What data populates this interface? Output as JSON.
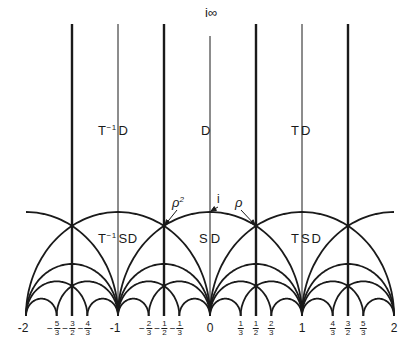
{
  "diagram": {
    "colors": {
      "line": "#1a1a1a",
      "background": "#ffffff"
    },
    "coords": {
      "origin_px_x": 210,
      "baseline_px_y": 316,
      "scale_x": 92,
      "scale_y": 104,
      "top_px_y": 24
    },
    "top_label": "i∞",
    "regions": {
      "t_inv_d": {
        "base": "T",
        "sup": "−1",
        "rest": "D"
      },
      "d": "D",
      "t_d": "TD",
      "t_inv_sd": {
        "base": "T",
        "sup": "−1",
        "rest": "SD"
      },
      "sd": "SD",
      "t_sd": "TSD"
    },
    "points": {
      "rho2": {
        "base": "ρ",
        "sup": "2"
      },
      "i": "i",
      "rho": "ρ"
    },
    "thick_verticals": [
      -1.5,
      -0.5,
      0.5,
      1.5
    ],
    "thin_verticals": [
      -1,
      0,
      1
    ],
    "axis_labels": {
      "integers": [
        {
          "value": -2,
          "text": "-2"
        },
        {
          "value": -1,
          "text": "-1"
        },
        {
          "value": 0,
          "text": "0"
        },
        {
          "value": 1,
          "text": "1"
        },
        {
          "value": 2,
          "text": "2"
        }
      ],
      "fractions": [
        {
          "value": -1.6667,
          "sign": "−",
          "num": "5",
          "den": "3"
        },
        {
          "value": -1.5,
          "sign": "−",
          "num": "3",
          "den": "2"
        },
        {
          "value": -1.3333,
          "sign": "−",
          "num": "4",
          "den": "3"
        },
        {
          "value": -0.6667,
          "sign": "−",
          "num": "2",
          "den": "3"
        },
        {
          "value": -0.5,
          "sign": "−",
          "num": "1",
          "den": "2"
        },
        {
          "value": -0.3333,
          "sign": "−",
          "num": "1",
          "den": "3"
        },
        {
          "value": 0.3333,
          "sign": "",
          "num": "1",
          "den": "3"
        },
        {
          "value": 0.5,
          "sign": "",
          "num": "1",
          "den": "2"
        },
        {
          "value": 0.6667,
          "sign": "",
          "num": "2",
          "den": "3"
        },
        {
          "value": 1.3333,
          "sign": "",
          "num": "4",
          "den": "3"
        },
        {
          "value": 1.5,
          "sign": "",
          "num": "3",
          "den": "2"
        },
        {
          "value": 1.6667,
          "sign": "",
          "num": "5",
          "den": "3"
        }
      ]
    }
  }
}
